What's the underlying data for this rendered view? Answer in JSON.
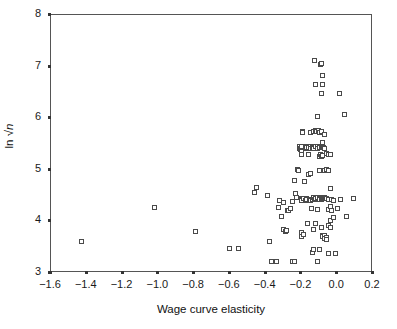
{
  "chart_data": {
    "type": "scatter",
    "title": "",
    "xlabel": "Wage curve elasticity",
    "ylabel": "ln √n",
    "ylabel_parts": {
      "prefix": "ln ",
      "radical": "√",
      "variable": "n"
    },
    "xlim": [
      -1.6,
      0.2
    ],
    "ylim": [
      3,
      8
    ],
    "xticks": [
      -1.6,
      -1.4,
      -1.2,
      -1.0,
      -0.8,
      -0.6,
      -0.4,
      -0.2,
      0.0,
      0.2
    ],
    "yticks": [
      3,
      4,
      5,
      6,
      7,
      8
    ],
    "xticklabels": [
      "−1.6",
      "−1.4",
      "−1.2",
      "−1.0",
      "−0.8",
      "−0.6",
      "−0.4",
      "−0.2",
      "0.0",
      "0.2"
    ],
    "yticklabels": [
      "3",
      "4",
      "5",
      "6",
      "7",
      "8"
    ],
    "grid": false,
    "legend": null,
    "marker": "open-square",
    "marker_color": "#4a4a4a",
    "frame_color": "#555555",
    "points": [
      [
        -1.43,
        3.61
      ],
      [
        -1.02,
        4.26
      ],
      [
        -0.79,
        3.81
      ],
      [
        -0.6,
        3.47
      ],
      [
        -0.55,
        3.47
      ],
      [
        -0.46,
        4.56
      ],
      [
        -0.45,
        4.65
      ],
      [
        -0.39,
        4.5
      ],
      [
        -0.38,
        3.61
      ],
      [
        -0.37,
        3.22
      ],
      [
        -0.34,
        3.22
      ],
      [
        -0.33,
        4.26
      ],
      [
        -0.32,
        4.41
      ],
      [
        -0.31,
        4.1
      ],
      [
        -0.3,
        4.37
      ],
      [
        -0.3,
        3.84
      ],
      [
        -0.29,
        3.8
      ],
      [
        -0.285,
        3.82
      ],
      [
        -0.28,
        4.22
      ],
      [
        -0.27,
        4.22
      ],
      [
        -0.26,
        4.25
      ],
      [
        -0.25,
        4.38
      ],
      [
        -0.25,
        3.22
      ],
      [
        -0.24,
        3.23
      ],
      [
        -0.24,
        4.8
      ],
      [
        -0.235,
        4.55
      ],
      [
        -0.23,
        4.47
      ],
      [
        -0.22,
        5.01
      ],
      [
        -0.215,
        4.99
      ],
      [
        -0.21,
        5.45
      ],
      [
        -0.21,
        5.42
      ],
      [
        -0.205,
        5.4
      ],
      [
        -0.2,
        5.44
      ],
      [
        -0.2,
        5.46
      ],
      [
        -0.2,
        5.36
      ],
      [
        -0.2,
        5.3
      ],
      [
        -0.2,
        4.45
      ],
      [
        -0.2,
        4.43
      ],
      [
        -0.2,
        4.4
      ],
      [
        -0.2,
        3.78
      ],
      [
        -0.2,
        3.7
      ],
      [
        -0.195,
        5.75
      ],
      [
        -0.195,
        5.72
      ],
      [
        -0.19,
        4.45
      ],
      [
        -0.19,
        3.75
      ],
      [
        -0.185,
        4.78
      ],
      [
        -0.18,
        5.46
      ],
      [
        -0.18,
        5.41
      ],
      [
        -0.18,
        4.41
      ],
      [
        -0.175,
        4.4
      ],
      [
        -0.17,
        5.44
      ],
      [
        -0.17,
        4.44
      ],
      [
        -0.17,
        4.42
      ],
      [
        -0.165,
        3.95
      ],
      [
        -0.16,
        5.43
      ],
      [
        -0.16,
        5.3
      ],
      [
        -0.16,
        4.9
      ],
      [
        -0.155,
        4.43
      ],
      [
        -0.15,
        5.72
      ],
      [
        -0.15,
        5.45
      ],
      [
        -0.15,
        5.42
      ],
      [
        -0.15,
        4.92
      ],
      [
        -0.15,
        4.4
      ],
      [
        -0.145,
        4.25
      ],
      [
        -0.14,
        5.44
      ],
      [
        -0.14,
        4.43
      ],
      [
        -0.14,
        3.4
      ],
      [
        -0.135,
        3.45
      ],
      [
        -0.13,
        5.75
      ],
      [
        -0.13,
        5.41
      ],
      [
        -0.13,
        4.46
      ],
      [
        -0.13,
        3.85
      ],
      [
        -0.125,
        7.12
      ],
      [
        -0.125,
        4.42
      ],
      [
        -0.12,
        6.65
      ],
      [
        -0.12,
        5.77
      ],
      [
        -0.12,
        5.45
      ],
      [
        -0.12,
        4.44
      ],
      [
        -0.12,
        3.96
      ],
      [
        -0.115,
        5.74
      ],
      [
        -0.11,
        6.03
      ],
      [
        -0.11,
        5.46
      ],
      [
        -0.11,
        5.42
      ],
      [
        -0.11,
        4.46
      ],
      [
        -0.11,
        4.24
      ],
      [
        -0.11,
        3.22
      ],
      [
        -0.105,
        5.76
      ],
      [
        -0.1,
        5.73
      ],
      [
        -0.1,
        5.44
      ],
      [
        -0.1,
        5.26
      ],
      [
        -0.1,
        4.98
      ],
      [
        -0.1,
        4.45
      ],
      [
        -0.1,
        4.43
      ],
      [
        -0.1,
        3.45
      ],
      [
        -0.095,
        7.05
      ],
      [
        -0.095,
        5.3
      ],
      [
        -0.09,
        7.06
      ],
      [
        -0.09,
        6.48
      ],
      [
        -0.09,
        5.74
      ],
      [
        -0.09,
        5.45
      ],
      [
        -0.09,
        5.25
      ],
      [
        -0.09,
        4.45
      ],
      [
        -0.09,
        4.42
      ],
      [
        -0.09,
        3.88
      ],
      [
        -0.085,
        5.43
      ],
      [
        -0.085,
        4.46
      ],
      [
        -0.08,
        6.82
      ],
      [
        -0.08,
        6.65
      ],
      [
        -0.08,
        5.52
      ],
      [
        -0.08,
        5.28
      ],
      [
        -0.08,
        4.47
      ],
      [
        -0.08,
        4.44
      ],
      [
        -0.08,
        3.73
      ],
      [
        -0.08,
        3.7
      ],
      [
        -0.075,
        5.44
      ],
      [
        -0.075,
        4.45
      ],
      [
        -0.07,
        5.68
      ],
      [
        -0.07,
        5.41
      ],
      [
        -0.07,
        4.99
      ],
      [
        -0.07,
        4.46
      ],
      [
        -0.07,
        3.72
      ],
      [
        -0.07,
        3.66
      ],
      [
        -0.065,
        4.44
      ],
      [
        -0.06,
        5.31
      ],
      [
        -0.06,
        5.0
      ],
      [
        -0.06,
        4.45
      ],
      [
        -0.06,
        3.68
      ],
      [
        -0.06,
        3.64
      ],
      [
        -0.05,
        5.29
      ],
      [
        -0.05,
        4.98
      ],
      [
        -0.05,
        4.42
      ],
      [
        -0.05,
        4.24
      ],
      [
        -0.05,
        3.92
      ],
      [
        -0.05,
        3.38
      ],
      [
        -0.04,
        5.3
      ],
      [
        -0.04,
        4.63
      ],
      [
        -0.04,
        4.28
      ],
      [
        -0.04,
        4.02
      ],
      [
        -0.04,
        3.89
      ],
      [
        -0.03,
        4.43
      ],
      [
        -0.03,
        4.22
      ],
      [
        -0.02,
        4.41
      ],
      [
        -0.02,
        4.08
      ],
      [
        -0.01,
        3.38
      ],
      [
        0.0,
        4.25
      ],
      [
        0.01,
        6.48
      ],
      [
        0.02,
        4.43
      ],
      [
        0.04,
        6.08
      ],
      [
        0.05,
        4.1
      ],
      [
        0.09,
        4.45
      ]
    ]
  },
  "axes": {
    "x_title": "Wage curve elasticity",
    "y_title_prefix": "ln ",
    "y_title_radical": "√",
    "y_title_var": "n"
  }
}
